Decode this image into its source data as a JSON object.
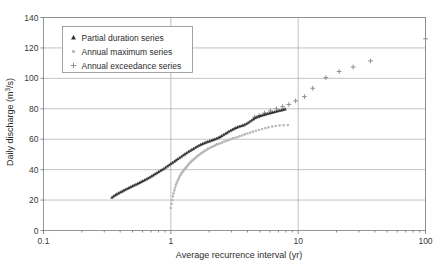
{
  "chart_data": {
    "type": "scatter",
    "title": "",
    "xlabel": "Average recurrence interval (yr)",
    "ylabel": "Daily discharge (m3/s)",
    "ylabel_display": "Daily discharge (m",
    "ylabel_exponent": "3",
    "ylabel_tail": "/s)",
    "xscale": "log",
    "yscale": "linear",
    "xlim": [
      0.1,
      100
    ],
    "ylim": [
      0,
      140
    ],
    "xticks": [
      0.1,
      1,
      10,
      100
    ],
    "xtick_labels": [
      "0.1",
      "1",
      "10",
      "100"
    ],
    "yticks": [
      0,
      20,
      40,
      60,
      80,
      100,
      120,
      140
    ],
    "ytick_labels": [
      "0",
      "20",
      "40",
      "60",
      "80",
      "100",
      "120",
      "140"
    ],
    "grid": "horizontal-and-vertical",
    "legend_position": "top-left-inside",
    "series": [
      {
        "name": "Partial duration series",
        "marker": "triangle",
        "color": "#2b2b2b",
        "points": [
          [
            0.345,
            21.8
          ],
          [
            0.355,
            22.6
          ],
          [
            0.366,
            23.3
          ],
          [
            0.377,
            24.0
          ],
          [
            0.389,
            24.6
          ],
          [
            0.401,
            25.2
          ],
          [
            0.414,
            25.8
          ],
          [
            0.427,
            26.4
          ],
          [
            0.44,
            27.0
          ],
          [
            0.454,
            27.5
          ],
          [
            0.469,
            28.1
          ],
          [
            0.484,
            28.7
          ],
          [
            0.499,
            29.2
          ],
          [
            0.515,
            29.8
          ],
          [
            0.532,
            30.3
          ],
          [
            0.549,
            30.9
          ],
          [
            0.566,
            31.4
          ],
          [
            0.585,
            32.0
          ],
          [
            0.603,
            32.6
          ],
          [
            0.623,
            33.2
          ],
          [
            0.643,
            33.8
          ],
          [
            0.663,
            34.4
          ],
          [
            0.685,
            35.1
          ],
          [
            0.707,
            35.8
          ],
          [
            0.729,
            36.5
          ],
          [
            0.753,
            37.2
          ],
          [
            0.777,
            37.9
          ],
          [
            0.802,
            38.6
          ],
          [
            0.828,
            39.3
          ],
          [
            0.854,
            40.0
          ],
          [
            0.882,
            40.7
          ],
          [
            0.91,
            41.5
          ],
          [
            0.94,
            42.3
          ],
          [
            0.97,
            43.1
          ],
          [
            1.001,
            43.9
          ],
          [
            1.033,
            44.7
          ],
          [
            1.067,
            45.5
          ],
          [
            1.101,
            46.3
          ],
          [
            1.136,
            47.1
          ],
          [
            1.173,
            47.9
          ],
          [
            1.211,
            48.7
          ],
          [
            1.25,
            49.5
          ],
          [
            1.29,
            50.3
          ],
          [
            1.332,
            51.0
          ],
          [
            1.375,
            51.8
          ],
          [
            1.419,
            52.5
          ],
          [
            1.465,
            53.2
          ],
          [
            1.512,
            53.9
          ],
          [
            1.561,
            54.6
          ],
          [
            1.611,
            55.3
          ],
          [
            1.663,
            55.9
          ],
          [
            1.717,
            56.5
          ],
          [
            1.772,
            57.0
          ],
          [
            1.83,
            57.5
          ],
          [
            1.889,
            58.0
          ],
          [
            1.95,
            58.4
          ],
          [
            2.013,
            58.8
          ],
          [
            2.078,
            59.2
          ],
          [
            2.145,
            59.6
          ],
          [
            2.214,
            60.0
          ],
          [
            2.286,
            60.5
          ],
          [
            2.36,
            61.0
          ],
          [
            2.436,
            61.6
          ],
          [
            2.515,
            62.3
          ],
          [
            2.596,
            63.0
          ],
          [
            2.68,
            63.7
          ],
          [
            2.767,
            64.4
          ],
          [
            2.856,
            65.1
          ],
          [
            2.948,
            65.8
          ],
          [
            3.043,
            66.4
          ],
          [
            3.142,
            67.0
          ],
          [
            3.243,
            67.5
          ],
          [
            3.347,
            68.0
          ],
          [
            3.455,
            68.4
          ],
          [
            3.567,
            68.8
          ],
          [
            3.682,
            69.2
          ],
          [
            3.8,
            69.6
          ],
          [
            3.923,
            70.2
          ],
          [
            4.049,
            70.9
          ],
          [
            4.18,
            71.7
          ],
          [
            4.315,
            72.5
          ],
          [
            4.454,
            73.3
          ],
          [
            4.598,
            74.0
          ],
          [
            4.746,
            74.6
          ],
          [
            4.899,
            75.0
          ],
          [
            5.057,
            75.4
          ],
          [
            5.22,
            75.8
          ],
          [
            5.389,
            76.1
          ],
          [
            5.563,
            76.5
          ],
          [
            5.742,
            76.8
          ],
          [
            5.927,
            77.1
          ],
          [
            6.118,
            77.4
          ],
          [
            6.316,
            77.7
          ],
          [
            6.52,
            78.0
          ],
          [
            6.73,
            78.3
          ],
          [
            6.947,
            78.6
          ],
          [
            7.171,
            78.9
          ],
          [
            7.402,
            79.2
          ],
          [
            7.641,
            79.5
          ],
          [
            7.888,
            79.8
          ]
        ]
      },
      {
        "name": "Annual maximum series",
        "marker": "square",
        "color": "#b3b3b3",
        "points": [
          [
            1.0,
            14.8
          ],
          [
            1.012,
            17.5
          ],
          [
            1.025,
            20.0
          ],
          [
            1.038,
            22.3
          ],
          [
            1.052,
            24.4
          ],
          [
            1.066,
            26.3
          ],
          [
            1.08,
            28.0
          ],
          [
            1.095,
            29.6
          ],
          [
            1.11,
            31.0
          ],
          [
            1.126,
            32.3
          ],
          [
            1.143,
            33.5
          ],
          [
            1.16,
            34.6
          ],
          [
            1.178,
            35.6
          ],
          [
            1.196,
            36.6
          ],
          [
            1.215,
            37.5
          ],
          [
            1.235,
            38.4
          ],
          [
            1.256,
            39.2
          ],
          [
            1.277,
            40.0
          ],
          [
            1.3,
            40.8
          ],
          [
            1.323,
            41.6
          ],
          [
            1.347,
            42.4
          ],
          [
            1.372,
            43.2
          ],
          [
            1.398,
            43.9
          ],
          [
            1.426,
            44.7
          ],
          [
            1.454,
            45.4
          ],
          [
            1.484,
            46.1
          ],
          [
            1.515,
            46.8
          ],
          [
            1.548,
            47.5
          ],
          [
            1.582,
            48.2
          ],
          [
            1.618,
            48.9
          ],
          [
            1.655,
            49.5
          ],
          [
            1.695,
            50.2
          ],
          [
            1.736,
            50.8
          ],
          [
            1.78,
            51.4
          ],
          [
            1.826,
            52.0
          ],
          [
            1.874,
            52.6
          ],
          [
            1.925,
            53.2
          ],
          [
            1.979,
            53.8
          ],
          [
            2.036,
            54.3
          ],
          [
            2.096,
            54.9
          ],
          [
            2.16,
            55.4
          ],
          [
            2.227,
            55.9
          ],
          [
            2.299,
            56.4
          ],
          [
            2.375,
            56.9
          ],
          [
            2.456,
            57.4
          ],
          [
            2.542,
            57.9
          ],
          [
            2.634,
            58.4
          ],
          [
            2.732,
            58.9
          ],
          [
            2.836,
            59.4
          ],
          [
            2.948,
            59.9
          ],
          [
            3.068,
            60.4
          ],
          [
            3.196,
            60.9
          ],
          [
            3.334,
            61.4
          ],
          [
            3.482,
            62.0
          ],
          [
            3.642,
            62.5
          ],
          [
            3.814,
            63.1
          ],
          [
            4.0,
            63.7
          ],
          [
            4.202,
            64.3
          ],
          [
            4.421,
            64.9
          ],
          [
            4.66,
            65.5
          ],
          [
            4.921,
            66.1
          ],
          [
            5.207,
            66.7
          ],
          [
            5.521,
            67.3
          ],
          [
            5.868,
            67.8
          ],
          [
            6.252,
            68.3
          ],
          [
            6.68,
            68.7
          ],
          [
            7.159,
            69.0
          ],
          [
            7.698,
            69.2
          ],
          [
            8.308,
            69.3
          ]
        ]
      },
      {
        "name": "Annual exceedance series",
        "marker": "plus",
        "color": "#8f8f8f",
        "points": [
          [
            4.55,
            74.5
          ],
          [
            4.95,
            75.6
          ],
          [
            5.45,
            77.2
          ],
          [
            6.05,
            78.6
          ],
          [
            6.75,
            80.0
          ],
          [
            7.55,
            81.4
          ],
          [
            8.45,
            82.8
          ],
          [
            9.55,
            85.2
          ],
          [
            11.2,
            88.0
          ],
          [
            13.0,
            93.5
          ],
          [
            16.5,
            100.5
          ],
          [
            21.0,
            104.5
          ],
          [
            27.0,
            107.5
          ],
          [
            37.0,
            111.5
          ],
          [
            100.0,
            126.0
          ]
        ]
      }
    ]
  },
  "legend": {
    "items": [
      {
        "label": "Partial duration series",
        "marker": "triangle",
        "color": "#2b2b2b"
      },
      {
        "label": "Annual maximum series",
        "marker": "square",
        "color": "#b3b3b3"
      },
      {
        "label": "Annual exceedance series",
        "marker": "plus",
        "color": "#8f8f8f"
      }
    ]
  },
  "colors": {
    "partial_duration": "#2b2b2b",
    "annual_maximum": "#b3b3b3",
    "annual_exceedance": "#8f8f8f",
    "gridline": "#a8a8a8",
    "frame": "#8c8c8c",
    "text": "#2c2c2c",
    "background": "#ffffff"
  }
}
